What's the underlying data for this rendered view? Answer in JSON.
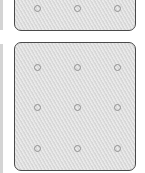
{
  "panels": [
    {
      "name": "top-panel",
      "top": -8,
      "height": 39,
      "holes": [
        [
          22,
          15
        ],
        [
          62,
          15
        ],
        [
          102,
          15
        ]
      ]
    },
    {
      "name": "bottom-panel",
      "top": 42,
      "height": 129,
      "holes": [
        [
          22,
          24
        ],
        [
          62,
          24
        ],
        [
          102,
          24
        ],
        [
          22,
          64
        ],
        [
          62,
          64
        ],
        [
          102,
          64
        ],
        [
          22,
          105
        ],
        [
          62,
          105
        ],
        [
          102,
          105
        ]
      ]
    }
  ],
  "colors": {
    "panel_fill": "#dedede",
    "panel_border": "#4a4a4a",
    "hole_border": "#909090"
  }
}
